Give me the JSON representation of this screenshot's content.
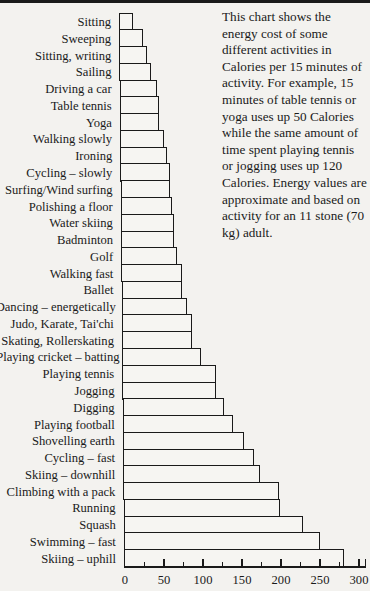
{
  "caption": "This chart shows the energy cost of some different activities in Calories per 15 minutes of activity. For example, 15 minutes of table tennis or yoga uses up 50 Calories while the same amount of time spent playing tennis or jogging uses up 120 Calories. Energy values are approximate and based on activity for an 11 stone (70 kg) adult.",
  "chart_data": {
    "type": "bar",
    "orientation": "horizontal",
    "title": "",
    "xlabel": "Calories per 15 minutes",
    "ylabel": "",
    "xlim": [
      0,
      300
    ],
    "xticks": [
      0,
      50,
      100,
      150,
      200,
      250,
      300
    ],
    "minor_ticks_every": 25,
    "grid": false,
    "legend": null,
    "categories": [
      "Sitting",
      "Sweeping",
      "Sitting, writing",
      "Sailing",
      "Driving a car",
      "Table tennis",
      "Yoga",
      "Walking slowly",
      "Ironing",
      "Cycling – slowly",
      "Surfing/Wind surfing",
      "Polishing a floor",
      "Water skiing",
      "Badminton",
      "Golf",
      "Walking fast",
      "Ballet",
      "Dancing – energetically",
      "Judo, Karate, Tai'chi",
      "Skating, Rollerskating",
      "Playing cricket – batting",
      "Playing tennis",
      "Jogging",
      "Digging",
      "Playing football",
      "Shovelling earth",
      "Cycling – fast",
      "Skiing – downhill",
      "Climbing with a pack",
      "Running",
      "Squash",
      "Swimming – fast",
      "Skiing – uphill"
    ],
    "values": [
      18,
      30,
      35,
      40,
      48,
      50,
      50,
      56,
      60,
      63,
      63,
      66,
      68,
      68,
      72,
      78,
      78,
      84,
      90,
      90,
      101,
      120,
      120,
      130,
      141,
      155,
      168,
      175,
      200,
      200,
      230,
      252,
      282
    ]
  },
  "axis": {
    "tick_labels": [
      "0",
      "50",
      "100",
      "150",
      "200",
      "250",
      "300"
    ]
  },
  "colors": {
    "ink": "#1a1a1a",
    "paper": "#f3f2ef"
  }
}
